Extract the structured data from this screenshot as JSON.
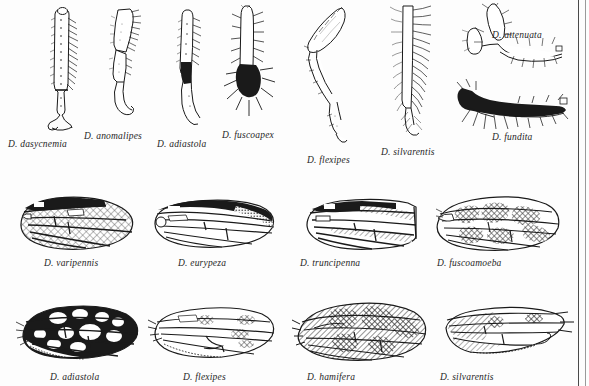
{
  "figure": {
    "background_color": "#fdfdfd",
    "ink_color": "#1a1a1a",
    "label_color": "#262626",
    "border_color": "#4a4a4a",
    "rows": [
      {
        "name": "legs-row",
        "subject": "leg",
        "count": 8
      },
      {
        "name": "wings-row-upper",
        "subject": "wing",
        "count": 4
      },
      {
        "name": "wings-row-lower",
        "subject": "wing",
        "count": 4
      }
    ]
  },
  "specimens": {
    "legs": [
      {
        "label": "D. dasycnemia",
        "icon": "leg-bristled-straight",
        "label_x": 8,
        "label_y": 139
      },
      {
        "label": "D. anomalipes",
        "icon": "leg-bent-slender",
        "label_x": 84,
        "label_y": 131
      },
      {
        "label": "D. anomalipes_x",
        "icon": "",
        "label_x": 0,
        "label_y": 0
      },
      {
        "label": "D. adiastola",
        "icon": "leg-dark-patch",
        "label_x": 157,
        "label_y": 139
      },
      {
        "label": "D. fuscoapex",
        "icon": "leg-black-apex",
        "label_x": 222,
        "label_y": 130
      },
      {
        "label": "D. flexipes",
        "icon": "leg-sharply-flexed",
        "label_x": 307,
        "label_y": 155
      },
      {
        "label": "D. silvarentis",
        "icon": "leg-plumose-comb",
        "label_x": 381,
        "label_y": 147
      },
      {
        "label": "D. attenuata",
        "icon": "leg-forked-attenuate",
        "label_x": 492,
        "label_y": 36
      },
      {
        "label": "D. fundita",
        "icon": "leg-dark-forked",
        "label_x": 492,
        "label_y": 138
      }
    ],
    "wings_upper": [
      {
        "label": "D. varipennis",
        "icon": "wing-crosshatch-broad",
        "label_x": 44,
        "label_y": 263
      },
      {
        "label": "D. eurypeza",
        "icon": "wing-dark-costal-margin",
        "label_x": 178,
        "label_y": 263
      },
      {
        "label": "D. truncipenna",
        "icon": "wing-truncate-apex",
        "label_x": 300,
        "label_y": 263
      },
      {
        "label": "D. fuscoamoeba",
        "icon": "wing-amoeboid-blotches",
        "label_x": 437,
        "label_y": 263
      }
    ],
    "wings_lower": [
      {
        "label": "D. adiastola",
        "icon": "wing-black-white-windows",
        "label_x": 50,
        "label_y": 377
      },
      {
        "label": "D. flexipes",
        "icon": "wing-clear-sparse-spots",
        "label_x": 183,
        "label_y": 377
      },
      {
        "label": "D. hamifera",
        "icon": "wing-mottled-bands",
        "label_x": 307,
        "label_y": 377
      },
      {
        "label": "D. silvarentis",
        "icon": "wing-hatched-anterior",
        "label_x": 440,
        "label_y": 377
      }
    ]
  }
}
